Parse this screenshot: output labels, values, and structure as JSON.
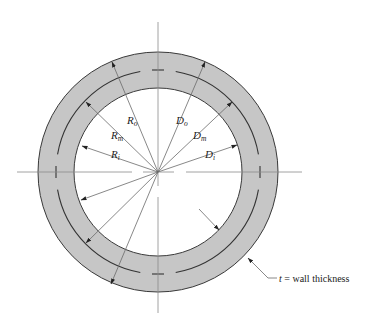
{
  "figure": {
    "type": "pipe cross-section dimension diagram",
    "center": {
      "x": 158,
      "y": 172
    },
    "radii": {
      "outer": 120,
      "mean": 102,
      "inner": 84
    },
    "colors": {
      "wall_fill": "#c6c6c6",
      "outline": "#3a3a3a",
      "axis_line": "#8a8a8a",
      "text": "#222222"
    }
  },
  "labels": {
    "R_o": {
      "main": "R",
      "sub": "o"
    },
    "R_m": {
      "main": "R",
      "sub": "m"
    },
    "R_i": {
      "main": "R",
      "sub": "i"
    },
    "D_o": {
      "main": "D",
      "sub": "o"
    },
    "D_m": {
      "main": "D",
      "sub": "m"
    },
    "D_i": {
      "main": "D",
      "sub": "i"
    }
  },
  "annotation": {
    "symbol": "t",
    "text": " = wall thickness"
  }
}
